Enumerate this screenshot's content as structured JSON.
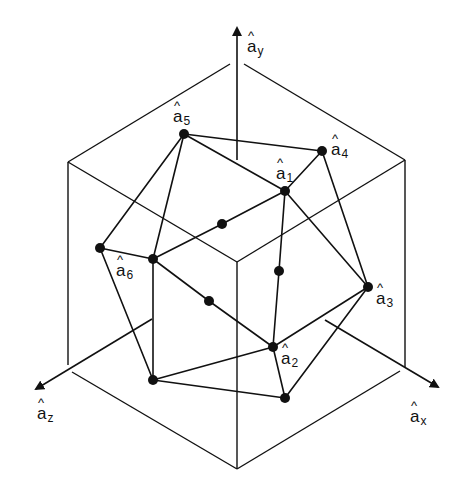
{
  "figure": {
    "type": "icosahedron-axes-in-cube",
    "axes": {
      "y": {
        "label_base": "a",
        "label_sub": "y"
      },
      "x": {
        "label_base": "a",
        "label_sub": "x"
      },
      "z": {
        "label_base": "a",
        "label_sub": "z"
      }
    },
    "vertices": [
      {
        "id": "a1",
        "label_base": "a",
        "label_sub": "1"
      },
      {
        "id": "a2",
        "label_base": "a",
        "label_sub": "2"
      },
      {
        "id": "a3",
        "label_base": "a",
        "label_sub": "3"
      },
      {
        "id": "a4",
        "label_base": "a",
        "label_sub": "4"
      },
      {
        "id": "a5",
        "label_base": "a",
        "label_sub": "5"
      },
      {
        "id": "a6",
        "label_base": "a",
        "label_sub": "6"
      }
    ],
    "colors": {
      "ink": "#111111",
      "background": "#ffffff"
    }
  }
}
